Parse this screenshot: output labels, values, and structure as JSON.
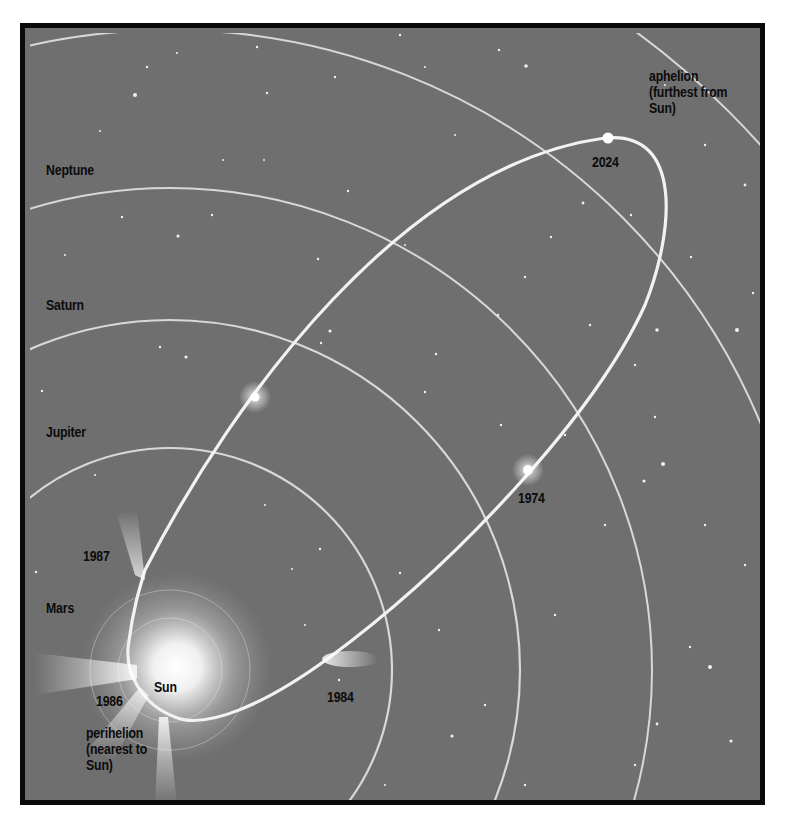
{
  "diagram": {
    "colors": {
      "background": "#6f6f6f",
      "frame": "#0a0a0a",
      "orbit_lines": "#d8d8d8",
      "comet_orbit": "#f2f2f2",
      "label_text": "#0b0b0b"
    },
    "planet_labels": {
      "neptune": "Neptune",
      "saturn": "Saturn",
      "jupiter": "Jupiter",
      "mars": "Mars"
    },
    "center_label": "Sun",
    "annotations": {
      "aphelion": "aphelion\n(furthest from\nSun)",
      "perihelion": "perihelion\n(nearest to\nSun)"
    },
    "comet_positions": [
      {
        "year": "2024",
        "note": "at aphelion"
      },
      {
        "year": "1974"
      },
      {
        "year": "1984"
      },
      {
        "year": "1987"
      },
      {
        "year": "1986",
        "note": "at perihelion"
      }
    ]
  }
}
